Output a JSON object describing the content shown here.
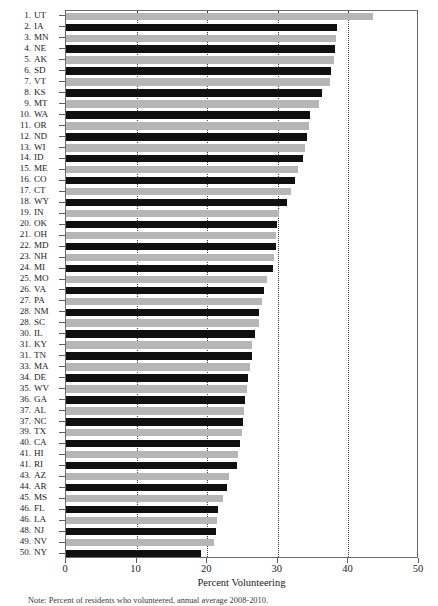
{
  "figure": {
    "background_color": "#ffffff",
    "frame_color": "#6b6b6b",
    "bar_dark_color": "#101010",
    "bar_light_color": "#b6b6b6",
    "gridline_color": "#3a3a3a"
  },
  "axis": {
    "x_title": "Percent Volunteering",
    "x_ticks": [
      0,
      10,
      20,
      30,
      40,
      50
    ],
    "x_tick_labels": [
      "0",
      "10",
      "20",
      "30",
      "40",
      "50"
    ],
    "x_min": 0,
    "x_max": 50,
    "gridlines_at": [
      10,
      20,
      30,
      40
    ]
  },
  "footnote": {
    "text": "Note: Percent of residents who volunteered, annual average 2008-2010."
  },
  "chart_data": {
    "type": "bar",
    "orientation": "horizontal",
    "title": "",
    "subtitle": "",
    "xlabel": "Percent Volunteering",
    "ylabel": "",
    "xlim": [
      0,
      50
    ],
    "grid": true,
    "legend": "none",
    "series_name": "Percent Volunteering",
    "ranks": [
      1,
      2,
      3,
      4,
      5,
      6,
      7,
      8,
      9,
      10,
      11,
      12,
      13,
      14,
      15,
      16,
      17,
      18,
      19,
      20,
      21,
      22,
      23,
      24,
      25,
      26,
      27,
      28,
      28,
      30,
      31,
      31,
      33,
      34,
      35,
      36,
      37,
      37,
      39,
      40,
      41,
      41,
      43,
      44,
      45,
      46,
      46,
      48,
      49,
      50
    ],
    "categories": [
      "UT",
      "IA",
      "MN",
      "NE",
      "AK",
      "SD",
      "VT",
      "KS",
      "MT",
      "WA",
      "OR",
      "ND",
      "WI",
      "ID",
      "ME",
      "CO",
      "CT",
      "WY",
      "IN",
      "OK",
      "OH",
      "MD",
      "NH",
      "MI",
      "MO",
      "VA",
      "PA",
      "NM",
      "SC",
      "IL",
      "KY",
      "TN",
      "MA",
      "DE",
      "WV",
      "GA",
      "AL",
      "NC",
      "TX",
      "CA",
      "HI",
      "RI",
      "AZ",
      "AR",
      "MS",
      "FL",
      "LA",
      "NJ",
      "NV",
      "NY"
    ],
    "values": [
      43.5,
      38.4,
      38.2,
      38.1,
      38.0,
      37.6,
      37.4,
      36.3,
      35.9,
      34.6,
      34.4,
      34.2,
      33.8,
      33.5,
      32.9,
      32.5,
      31.9,
      31.3,
      30.2,
      29.9,
      29.8,
      29.7,
      29.5,
      29.3,
      28.5,
      28.1,
      27.7,
      27.4,
      27.3,
      26.7,
      26.4,
      26.3,
      26.1,
      25.8,
      25.6,
      25.4,
      25.2,
      25.1,
      24.9,
      24.7,
      24.3,
      24.2,
      23.1,
      22.8,
      22.3,
      21.5,
      21.4,
      21.2,
      20.9,
      19.1
    ],
    "bar_shading": [
      "light",
      "dark",
      "light",
      "dark",
      "light",
      "dark",
      "light",
      "dark",
      "light",
      "dark",
      "light",
      "dark",
      "light",
      "dark",
      "light",
      "dark",
      "light",
      "dark",
      "light",
      "dark",
      "light",
      "dark",
      "light",
      "dark",
      "light",
      "dark",
      "light",
      "dark",
      "light",
      "dark",
      "light",
      "dark",
      "light",
      "dark",
      "light",
      "dark",
      "light",
      "dark",
      "light",
      "dark",
      "light",
      "dark",
      "light",
      "dark",
      "light",
      "dark",
      "light",
      "dark",
      "light",
      "dark"
    ]
  }
}
